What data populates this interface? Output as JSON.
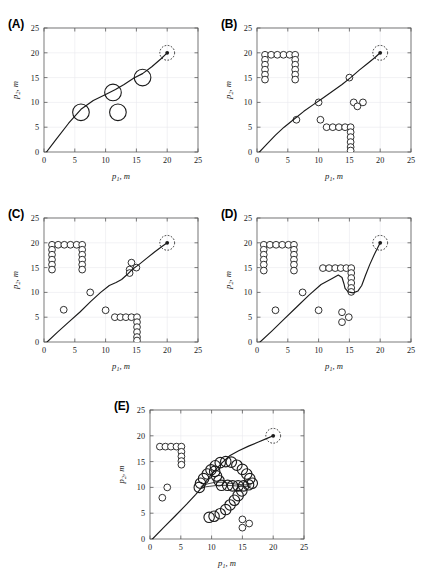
{
  "figure": {
    "background_color": "#ffffff",
    "line_color": "#1a1a1a",
    "grid_color": "#e8e8ec",
    "axis_color": "#5a5a5a",
    "marker_fill": "#ffffff",
    "marker_stroke": "#1a1a1a"
  },
  "axes": {
    "x_label_main": "p",
    "x_label_sub": "1",
    "x_label_unit": ", m",
    "y_label_main": "p",
    "y_label_sub": "2",
    "y_label_unit": ", m",
    "x_ticks": [
      "0",
      "5",
      "10",
      "15",
      "20",
      "25"
    ],
    "y_ticks": [
      "0",
      "5",
      "10",
      "15",
      "20",
      "25"
    ],
    "xlim": [
      0,
      25
    ],
    "ylim": [
      0,
      25
    ],
    "grid": true
  },
  "panels": [
    {
      "id": "A",
      "label": "(A)"
    },
    {
      "id": "B",
      "label": "(B)"
    },
    {
      "id": "C",
      "label": "(C)"
    },
    {
      "id": "D",
      "label": "(D)"
    },
    {
      "id": "E",
      "label": "(E)"
    }
  ],
  "chart_data": [
    {
      "type": "scatter",
      "panel": "A",
      "title": "(A)",
      "xlabel": "p1, m",
      "ylabel": "p2, m",
      "xlim": [
        0,
        25
      ],
      "ylim": [
        0,
        25
      ],
      "grid": true,
      "obstacles_large": [
        {
          "x": 6.0,
          "y": 8.0,
          "r": 1.35
        },
        {
          "x": 11.2,
          "y": 12.0,
          "r": 1.35
        },
        {
          "x": 12.0,
          "y": 8.0,
          "r": 1.35
        },
        {
          "x": 16.0,
          "y": 15.0,
          "r": 1.35
        }
      ],
      "obstacles_small": [],
      "target": {
        "x": 20.0,
        "y": 20.0,
        "halo_radius": 1.2
      },
      "path": [
        [
          0.4,
          0.0
        ],
        [
          2.0,
          2.6
        ],
        [
          4.0,
          5.8
        ],
        [
          6.0,
          8.6
        ],
        [
          8.0,
          10.4
        ],
        [
          10.0,
          11.6
        ],
        [
          11.6,
          12.6
        ],
        [
          13.0,
          13.6
        ],
        [
          14.6,
          14.9
        ],
        [
          16.0,
          15.8
        ],
        [
          17.5,
          17.2
        ],
        [
          19.0,
          18.8
        ],
        [
          20.0,
          20.0
        ]
      ]
    },
    {
      "type": "scatter",
      "panel": "B",
      "title": "(B)",
      "xlabel": "p1, m",
      "ylabel": "p2, m",
      "xlim": [
        0,
        25
      ],
      "ylim": [
        0,
        25
      ],
      "grid": true,
      "obstacles_large": [],
      "obstacles_small": [
        {
          "x": 1.3,
          "y": 19.6
        },
        {
          "x": 2.3,
          "y": 19.6
        },
        {
          "x": 3.3,
          "y": 19.6
        },
        {
          "x": 4.3,
          "y": 19.6
        },
        {
          "x": 5.3,
          "y": 19.6
        },
        {
          "x": 6.2,
          "y": 19.6
        },
        {
          "x": 1.3,
          "y": 18.6
        },
        {
          "x": 1.3,
          "y": 17.6
        },
        {
          "x": 1.3,
          "y": 16.6
        },
        {
          "x": 1.3,
          "y": 15.6
        },
        {
          "x": 1.3,
          "y": 14.6
        },
        {
          "x": 6.2,
          "y": 18.6
        },
        {
          "x": 6.2,
          "y": 17.6
        },
        {
          "x": 6.2,
          "y": 16.6
        },
        {
          "x": 6.2,
          "y": 15.6
        },
        {
          "x": 6.2,
          "y": 14.6
        },
        {
          "x": 6.4,
          "y": 6.5
        },
        {
          "x": 10.0,
          "y": 10.0
        },
        {
          "x": 10.3,
          "y": 6.5
        },
        {
          "x": 15.0,
          "y": 15.0
        },
        {
          "x": 15.7,
          "y": 10.0
        },
        {
          "x": 17.2,
          "y": 10.0
        },
        {
          "x": 16.3,
          "y": 9.2
        },
        {
          "x": 11.3,
          "y": 5.0
        },
        {
          "x": 12.3,
          "y": 5.0
        },
        {
          "x": 13.3,
          "y": 5.0
        },
        {
          "x": 14.3,
          "y": 5.0
        },
        {
          "x": 15.2,
          "y": 5.0
        },
        {
          "x": 15.2,
          "y": 4.0
        },
        {
          "x": 15.2,
          "y": 3.0
        },
        {
          "x": 15.2,
          "y": 2.0
        },
        {
          "x": 15.2,
          "y": 1.0
        },
        {
          "x": 15.2,
          "y": 0.3
        }
      ],
      "target": {
        "x": 20.0,
        "y": 20.0,
        "halo_radius": 1.2
      },
      "path": [
        [
          0.4,
          0.0
        ],
        [
          1.6,
          1.6
        ],
        [
          3.0,
          3.4
        ],
        [
          4.4,
          5.0
        ],
        [
          6.0,
          6.6
        ],
        [
          7.6,
          8.2
        ],
        [
          9.2,
          9.6
        ],
        [
          10.6,
          10.8
        ],
        [
          12.2,
          12.2
        ],
        [
          13.8,
          13.6
        ],
        [
          15.2,
          15.0
        ],
        [
          16.6,
          16.5
        ],
        [
          18.0,
          17.9
        ],
        [
          19.2,
          19.1
        ],
        [
          20.0,
          20.0
        ]
      ]
    },
    {
      "type": "scatter",
      "panel": "C",
      "title": "(C)",
      "xlabel": "p1, m",
      "ylabel": "p2, m",
      "xlim": [
        0,
        25
      ],
      "ylim": [
        0,
        25
      ],
      "grid": true,
      "obstacles_large": [],
      "obstacles_small": [
        {
          "x": 1.3,
          "y": 19.6
        },
        {
          "x": 2.3,
          "y": 19.6
        },
        {
          "x": 3.3,
          "y": 19.6
        },
        {
          "x": 4.3,
          "y": 19.6
        },
        {
          "x": 5.3,
          "y": 19.6
        },
        {
          "x": 6.2,
          "y": 19.6
        },
        {
          "x": 1.3,
          "y": 18.6
        },
        {
          "x": 1.3,
          "y": 17.6
        },
        {
          "x": 1.3,
          "y": 16.6
        },
        {
          "x": 1.3,
          "y": 15.6
        },
        {
          "x": 1.3,
          "y": 14.6
        },
        {
          "x": 6.2,
          "y": 18.6
        },
        {
          "x": 6.2,
          "y": 17.6
        },
        {
          "x": 6.2,
          "y": 16.6
        },
        {
          "x": 6.2,
          "y": 15.6
        },
        {
          "x": 6.2,
          "y": 14.6
        },
        {
          "x": 3.2,
          "y": 6.5
        },
        {
          "x": 7.5,
          "y": 10.0
        },
        {
          "x": 10.0,
          "y": 6.4
        },
        {
          "x": 14.2,
          "y": 16.0
        },
        {
          "x": 15.0,
          "y": 15.0
        },
        {
          "x": 13.9,
          "y": 14.6
        },
        {
          "x": 13.9,
          "y": 13.9
        },
        {
          "x": 11.5,
          "y": 5.0
        },
        {
          "x": 12.4,
          "y": 5.0
        },
        {
          "x": 13.3,
          "y": 5.0
        },
        {
          "x": 14.2,
          "y": 5.0
        },
        {
          "x": 15.1,
          "y": 5.0
        },
        {
          "x": 15.1,
          "y": 4.0
        },
        {
          "x": 15.1,
          "y": 3.0
        },
        {
          "x": 15.1,
          "y": 2.0
        },
        {
          "x": 15.1,
          "y": 1.0
        },
        {
          "x": 15.1,
          "y": 0.3
        }
      ],
      "target": {
        "x": 20.0,
        "y": 20.0,
        "halo_radius": 1.2
      },
      "path": [
        [
          0.5,
          0.0
        ],
        [
          2.2,
          2.0
        ],
        [
          4.0,
          4.0
        ],
        [
          5.8,
          6.0
        ],
        [
          7.6,
          8.2
        ],
        [
          9.2,
          10.0
        ],
        [
          10.6,
          11.4
        ],
        [
          11.7,
          12.0
        ],
        [
          12.6,
          12.6
        ],
        [
          13.5,
          13.6
        ],
        [
          14.3,
          14.6
        ],
        [
          15.4,
          15.6
        ],
        [
          16.6,
          16.8
        ],
        [
          18.0,
          18.2
        ],
        [
          19.2,
          19.3
        ],
        [
          20.0,
          20.0
        ]
      ]
    },
    {
      "type": "scatter",
      "panel": "D",
      "title": "(D)",
      "xlabel": "p1, m",
      "ylabel": "p2, m",
      "xlim": [
        0,
        25
      ],
      "ylim": [
        0,
        25
      ],
      "grid": true,
      "obstacles_large": [],
      "obstacles_small": [
        {
          "x": 1.1,
          "y": 19.6
        },
        {
          "x": 2.1,
          "y": 19.6
        },
        {
          "x": 3.1,
          "y": 19.6
        },
        {
          "x": 4.1,
          "y": 19.6
        },
        {
          "x": 5.1,
          "y": 19.6
        },
        {
          "x": 6.0,
          "y": 19.6
        },
        {
          "x": 1.1,
          "y": 18.6
        },
        {
          "x": 1.1,
          "y": 17.6
        },
        {
          "x": 1.1,
          "y": 16.6
        },
        {
          "x": 1.1,
          "y": 15.6
        },
        {
          "x": 1.1,
          "y": 14.4
        },
        {
          "x": 6.0,
          "y": 18.6
        },
        {
          "x": 6.0,
          "y": 17.6
        },
        {
          "x": 6.0,
          "y": 16.6
        },
        {
          "x": 6.0,
          "y": 15.6
        },
        {
          "x": 6.0,
          "y": 14.4
        },
        {
          "x": 3.0,
          "y": 6.4
        },
        {
          "x": 7.4,
          "y": 10.0
        },
        {
          "x": 10.0,
          "y": 6.4
        },
        {
          "x": 13.8,
          "y": 6.0
        },
        {
          "x": 14.9,
          "y": 5.0
        },
        {
          "x": 13.8,
          "y": 4.0
        },
        {
          "x": 10.7,
          "y": 14.9
        },
        {
          "x": 11.7,
          "y": 14.9
        },
        {
          "x": 12.7,
          "y": 14.9
        },
        {
          "x": 13.6,
          "y": 14.9
        },
        {
          "x": 14.5,
          "y": 14.9
        },
        {
          "x": 15.3,
          "y": 14.9
        },
        {
          "x": 15.3,
          "y": 13.9
        },
        {
          "x": 15.3,
          "y": 12.9
        },
        {
          "x": 15.3,
          "y": 11.9
        },
        {
          "x": 15.3,
          "y": 10.9
        },
        {
          "x": 15.3,
          "y": 10.1
        }
      ],
      "target": {
        "x": 20.0,
        "y": 20.0,
        "halo_radius": 1.2
      },
      "path": [
        [
          0.5,
          0.0
        ],
        [
          2.4,
          2.2
        ],
        [
          4.4,
          4.6
        ],
        [
          6.4,
          7.0
        ],
        [
          8.4,
          9.4
        ],
        [
          10.4,
          11.6
        ],
        [
          12.2,
          12.8
        ],
        [
          13.2,
          13.5
        ],
        [
          13.8,
          13.0
        ],
        [
          14.1,
          11.8
        ],
        [
          14.3,
          10.8
        ],
        [
          14.8,
          10.1
        ],
        [
          15.6,
          9.9
        ],
        [
          16.4,
          10.3
        ],
        [
          17.0,
          11.4
        ],
        [
          17.6,
          13.4
        ],
        [
          18.3,
          15.6
        ],
        [
          19.1,
          17.8
        ],
        [
          20.0,
          20.0
        ]
      ]
    },
    {
      "type": "scatter",
      "panel": "E",
      "title": "(E)",
      "xlabel": "p1, m",
      "ylabel": "p2, m",
      "xlim": [
        0,
        25
      ],
      "ylim": [
        0,
        25
      ],
      "grid": true,
      "obstacles_large": [
        {
          "x": 10.6,
          "y": 14.2,
          "r": 0.85
        },
        {
          "x": 11.4,
          "y": 14.8,
          "r": 0.85
        },
        {
          "x": 12.3,
          "y": 15.0,
          "r": 0.85
        },
        {
          "x": 13.2,
          "y": 14.9,
          "r": 0.85
        },
        {
          "x": 14.1,
          "y": 14.3,
          "r": 0.85
        },
        {
          "x": 9.9,
          "y": 13.4,
          "r": 0.85
        },
        {
          "x": 9.3,
          "y": 12.6,
          "r": 0.85
        },
        {
          "x": 8.7,
          "y": 11.7,
          "r": 0.85
        },
        {
          "x": 8.2,
          "y": 10.8,
          "r": 0.85
        },
        {
          "x": 8.0,
          "y": 10.0,
          "r": 0.85
        },
        {
          "x": 10.5,
          "y": 13.1,
          "r": 0.85
        },
        {
          "x": 10.8,
          "y": 12.2,
          "r": 0.85
        },
        {
          "x": 11.2,
          "y": 11.3,
          "r": 0.85
        },
        {
          "x": 11.6,
          "y": 10.4,
          "r": 0.85
        },
        {
          "x": 15.0,
          "y": 13.5,
          "r": 0.85
        },
        {
          "x": 15.7,
          "y": 12.6,
          "r": 0.85
        },
        {
          "x": 16.2,
          "y": 11.7,
          "r": 0.85
        },
        {
          "x": 16.6,
          "y": 10.8,
          "r": 0.85
        },
        {
          "x": 12.6,
          "y": 10.4,
          "r": 0.85
        },
        {
          "x": 13.4,
          "y": 10.3,
          "r": 0.85
        },
        {
          "x": 14.3,
          "y": 10.3,
          "r": 0.85
        },
        {
          "x": 15.2,
          "y": 10.3,
          "r": 0.85
        },
        {
          "x": 16.0,
          "y": 10.5,
          "r": 0.85
        },
        {
          "x": 14.9,
          "y": 9.3,
          "r": 0.85
        },
        {
          "x": 14.3,
          "y": 8.4,
          "r": 0.85
        },
        {
          "x": 13.7,
          "y": 7.5,
          "r": 0.85
        },
        {
          "x": 13.0,
          "y": 6.6,
          "r": 0.85
        },
        {
          "x": 12.3,
          "y": 5.7,
          "r": 0.85
        },
        {
          "x": 11.4,
          "y": 4.9,
          "r": 0.85
        },
        {
          "x": 10.4,
          "y": 4.4,
          "r": 0.85
        },
        {
          "x": 9.6,
          "y": 4.2,
          "r": 0.85
        }
      ],
      "obstacles_small": [
        {
          "x": 1.6,
          "y": 17.9
        },
        {
          "x": 2.5,
          "y": 17.9
        },
        {
          "x": 3.4,
          "y": 17.9
        },
        {
          "x": 4.3,
          "y": 17.9
        },
        {
          "x": 5.1,
          "y": 17.9
        },
        {
          "x": 5.1,
          "y": 16.9
        },
        {
          "x": 5.1,
          "y": 16.0
        },
        {
          "x": 5.1,
          "y": 15.1
        },
        {
          "x": 5.1,
          "y": 14.4
        },
        {
          "x": 2.8,
          "y": 10.0
        },
        {
          "x": 2.0,
          "y": 8.0
        },
        {
          "x": 15.0,
          "y": 3.8
        },
        {
          "x": 16.1,
          "y": 3.0
        },
        {
          "x": 15.0,
          "y": 2.2
        }
      ],
      "target": {
        "x": 20.0,
        "y": 20.0,
        "halo_radius": 1.2
      },
      "path": [
        [
          0.4,
          0.0
        ],
        [
          2.2,
          2.2
        ],
        [
          4.2,
          4.6
        ],
        [
          6.0,
          6.8
        ],
        [
          7.4,
          8.6
        ],
        [
          8.2,
          9.7
        ],
        [
          9.0,
          11.0
        ],
        [
          9.9,
          12.4
        ],
        [
          10.9,
          13.8
        ],
        [
          11.9,
          15.0
        ],
        [
          13.0,
          16.2
        ],
        [
          14.4,
          17.1
        ],
        [
          16.0,
          18.0
        ],
        [
          17.6,
          18.8
        ],
        [
          19.0,
          19.5
        ],
        [
          20.0,
          20.0
        ]
      ],
      "path_secondary": [
        [
          8.3,
          10.2
        ],
        [
          9.4,
          10.7
        ],
        [
          10.6,
          11.0
        ],
        [
          11.8,
          11.0
        ],
        [
          13.0,
          10.8
        ],
        [
          14.2,
          10.6
        ],
        [
          15.4,
          10.5
        ],
        [
          16.4,
          10.5
        ]
      ],
      "path_tertiary": [
        [
          8.3,
          10.0
        ],
        [
          9.6,
          10.2
        ],
        [
          11.0,
          10.4
        ],
        [
          12.4,
          10.4
        ],
        [
          13.8,
          10.3
        ],
        [
          15.2,
          10.2
        ],
        [
          16.3,
          10.2
        ]
      ]
    }
  ]
}
